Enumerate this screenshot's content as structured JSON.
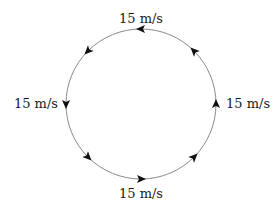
{
  "diagram": {
    "circle": {
      "cx": 141,
      "cy": 104,
      "r": 75,
      "stroke": "#8a8a8a"
    },
    "direction": "counterclockwise",
    "arrow_color": "#111111",
    "arrows_deg": [
      0,
      45,
      90,
      135,
      180,
      225,
      270,
      315
    ],
    "labels": {
      "top": "15 m/s",
      "left": "15 m/s",
      "right": "15 m/s",
      "bottom": "15 m/s"
    }
  }
}
